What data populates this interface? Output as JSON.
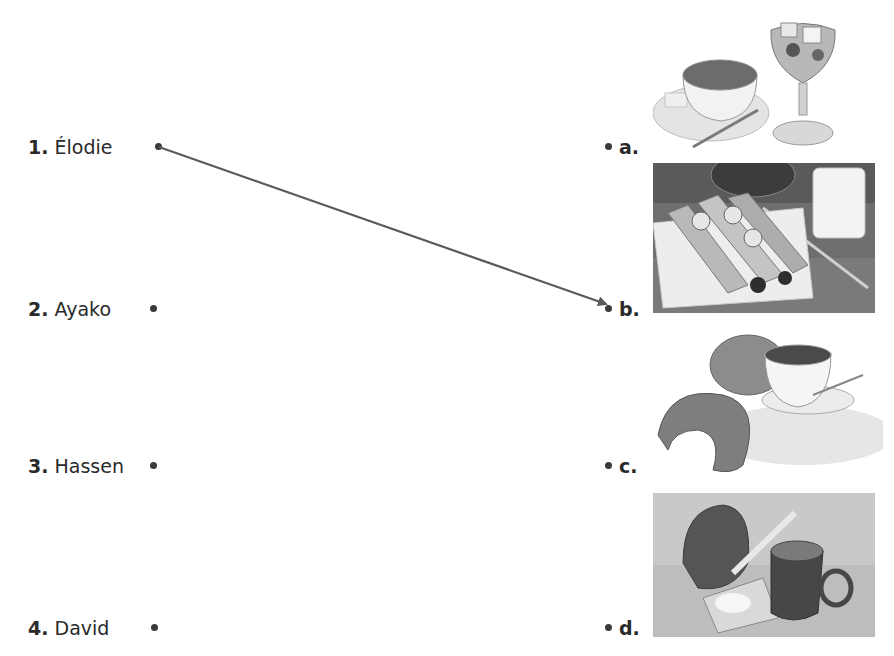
{
  "exercise": {
    "people": [
      {
        "number": "1.",
        "name": "Élodie"
      },
      {
        "number": "2.",
        "name": "Ayako"
      },
      {
        "number": "3.",
        "name": "Hassen"
      },
      {
        "number": "4.",
        "name": "David"
      }
    ],
    "options": [
      {
        "letter": "a.",
        "image": "tea-cup-and-fruit-sundae-photo"
      },
      {
        "letter": "b.",
        "image": "crepes-with-milk-photo"
      },
      {
        "letter": "c.",
        "image": "croissants-and-hot-chocolate-photo"
      },
      {
        "letter": "d.",
        "image": "bread-butter-and-coffee-mug-photo"
      }
    ],
    "connections": [
      {
        "from": "1.",
        "to": "b."
      }
    ]
  }
}
